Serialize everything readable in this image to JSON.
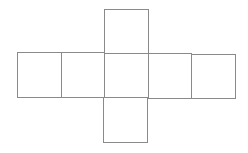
{
  "diagram": {
    "type": "net",
    "stroke_color": "#8a8a8a",
    "background": "#ffffff",
    "squares": [
      {
        "id": "top",
        "x": 104,
        "y": 9,
        "w": 44,
        "h": 44
      },
      {
        "id": "row-1",
        "x": 17,
        "y": 52,
        "w": 44,
        "h": 45
      },
      {
        "id": "row-2",
        "x": 61,
        "y": 52,
        "w": 43,
        "h": 45
      },
      {
        "id": "center",
        "x": 104,
        "y": 53,
        "w": 44,
        "h": 44
      },
      {
        "id": "row-4",
        "x": 148,
        "y": 53,
        "w": 43,
        "h": 45
      },
      {
        "id": "row-5",
        "x": 191,
        "y": 54,
        "w": 44,
        "h": 44
      },
      {
        "id": "bottom",
        "x": 103,
        "y": 97,
        "w": 44,
        "h": 45
      }
    ]
  }
}
